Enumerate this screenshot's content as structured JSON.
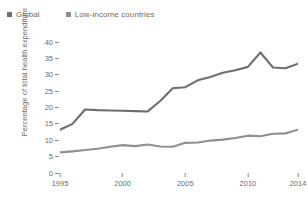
{
  "chart_data": {
    "type": "line",
    "title": "",
    "xlabel": "",
    "ylabel": "Percentage of total health expenditure",
    "xlim": [
      1995,
      2014
    ],
    "ylim": [
      0,
      40
    ],
    "yticks": [
      40,
      35,
      30,
      25,
      20,
      15,
      10,
      5,
      0
    ],
    "xticks": [
      1995,
      2000,
      2005,
      2010,
      2014
    ],
    "grid": false,
    "legend_position": "top-left",
    "x": [
      1995,
      1996,
      1997,
      1998,
      1999,
      2000,
      2001,
      2002,
      2003,
      2004,
      2005,
      2006,
      2007,
      2008,
      2009,
      2010,
      2011,
      2012,
      2013,
      2014
    ],
    "series": [
      {
        "name": "Global",
        "color": "#6e6e6e",
        "values": [
          13.2,
          15.0,
          19.4,
          19.2,
          19.1,
          19.0,
          18.9,
          18.8,
          22.0,
          25.9,
          26.2,
          28.3,
          29.3,
          30.6,
          31.4,
          32.4,
          36.8,
          32.2,
          32.0,
          33.4
        ]
      },
      {
        "name": "Low-income countries",
        "color": "#8f8f8f",
        "values": [
          6.3,
          6.6,
          7.0,
          7.4,
          8.0,
          8.5,
          8.2,
          8.7,
          8.1,
          8.0,
          9.2,
          9.3,
          9.9,
          10.2,
          10.7,
          11.4,
          11.2,
          12.0,
          12.1,
          13.2
        ]
      }
    ]
  },
  "legend": {
    "items": [
      {
        "label": "Global",
        "color": "#6e6e6e"
      },
      {
        "label": "Low-income countries",
        "color": "#8f8f8f"
      }
    ]
  },
  "axes": {
    "y_title": "Percentage of total health expenditure"
  }
}
